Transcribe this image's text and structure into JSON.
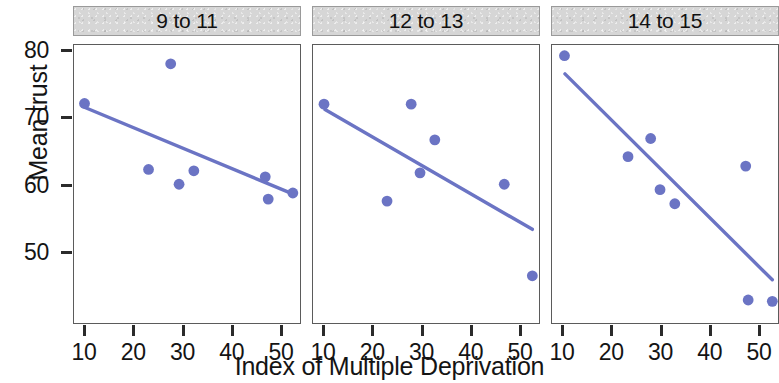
{
  "chart_data": {
    "type": "scatter",
    "title": "",
    "xlabel": "Index of Multiple Deprivation",
    "ylabel": "Mean trust",
    "xlim": [
      5,
      55
    ],
    "ylim": [
      41,
      81
    ],
    "xticks": [
      10,
      20,
      30,
      40,
      50
    ],
    "yticks": [
      80,
      70,
      60,
      50
    ],
    "grid": false,
    "legend": "none",
    "point_color": "#6b74c4",
    "line_color": "#6b74c4",
    "panels": [
      {
        "label": "9 to 11",
        "x": [
          9.9,
          22.9,
          27.4,
          29.1,
          32.1,
          46.6,
          47.2,
          52.2
        ],
        "y": [
          72.2,
          62.4,
          78.1,
          60.2,
          62.2,
          61.3,
          58.0,
          58.9
        ],
        "fit_line": {
          "x0": 10.0,
          "y0": 71.6,
          "x1": 52.4,
          "y1": 58.7
        }
      },
      {
        "label": "12 to 13",
        "x": [
          10.0,
          22.8,
          27.7,
          29.5,
          32.5,
          46.6,
          52.3
        ],
        "y": [
          72.1,
          57.7,
          72.1,
          61.9,
          66.8,
          60.2,
          46.6
        ],
        "fit_line": {
          "x0": 10.2,
          "y0": 71.3,
          "x1": 52.3,
          "y1": 53.5
        }
      },
      {
        "label": "14 to 15",
        "x": [
          10.3,
          23.2,
          27.8,
          29.7,
          32.7,
          47.1,
          47.6,
          52.5
        ],
        "y": [
          79.3,
          64.3,
          67.0,
          59.4,
          57.3,
          62.9,
          43.0,
          42.8
        ],
        "fit_line": {
          "x0": 10.4,
          "y0": 76.6,
          "x1": 52.5,
          "y1": 46.0
        }
      }
    ]
  },
  "axes": {
    "y_tick_labels": [
      "80",
      "70",
      "60",
      "50"
    ],
    "x_tick_labels": [
      "10",
      "20",
      "30",
      "40",
      "50"
    ],
    "y_axis_title": "Mean trust",
    "x_axis_title": "Index of Multiple Deprivation"
  },
  "panels_meta": [
    {
      "strip_label": "9 to 11"
    },
    {
      "strip_label": "12 to 13"
    },
    {
      "strip_label": "14 to 15"
    }
  ]
}
